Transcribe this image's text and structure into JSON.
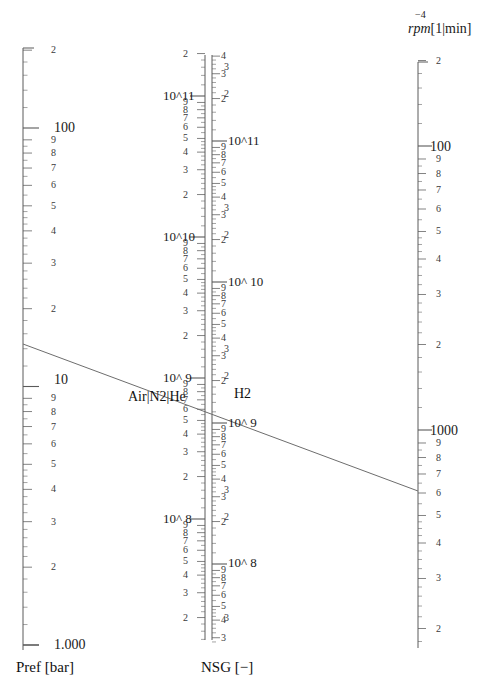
{
  "figure": {
    "type": "nomogram"
  },
  "axes": {
    "pref": {
      "title": "Pref [bar]",
      "orientation": "vertical",
      "direction": "ascending-upward",
      "scale": "log10",
      "top_value": "100",
      "bottom_value": "1.000",
      "decade_labels": [
        "1.000",
        "10",
        "100"
      ],
      "minor_labels": [
        "2",
        "3",
        "4",
        "5",
        "6",
        "7",
        "8",
        "9"
      ]
    },
    "nsg_left": {
      "title": "NSG [−]",
      "group_label": "Air|N2|He",
      "scale": "log10",
      "decade_labels": [
        "10^11",
        "10^10",
        "10^ 9",
        "10^ 8"
      ],
      "minor_labels": [
        "2",
        "3",
        "4",
        "5",
        "6",
        "7",
        "8",
        "9"
      ]
    },
    "nsg_right": {
      "group_label": "H2",
      "scale": "log10",
      "decade_labels": [
        "10^11",
        "10^ 10",
        "10^ 9",
        "10^ 8"
      ],
      "minor_labels": [
        "2",
        "3",
        "4",
        "5",
        "6",
        "7",
        "8",
        "9"
      ]
    },
    "rpm": {
      "title_italic": "rpm",
      "title_unit": "[1|min]",
      "exponent": "−4",
      "orientation": "vertical",
      "direction": "descending-downward",
      "scale": "log10",
      "decade_labels": [
        "100",
        "1000"
      ],
      "minor_labels": [
        "2",
        "3",
        "4",
        "5",
        "6",
        "7",
        "8",
        "9"
      ]
    }
  },
  "chart_data": {
    "type": "line",
    "title": "",
    "xlabel": "",
    "ylabel": "",
    "grid": false,
    "legend": "none",
    "scales": [
      {
        "name": "Pref [bar]",
        "type": "log",
        "range": [
          1.0,
          100.0
        ],
        "position": "left"
      },
      {
        "name": "NSG [-] Air|N2|He",
        "type": "log",
        "range": [
          100000000.0,
          300000000000.0
        ],
        "position": "center-left"
      },
      {
        "name": "NSG [-] H2",
        "type": "log",
        "range": [
          100000000.0,
          300000000000.0
        ],
        "position": "center-right"
      },
      {
        "name": "rpm [1/min]",
        "type": "log",
        "range": [
          50,
          5000
        ],
        "position": "right",
        "reversed": true
      }
    ],
    "series": [
      {
        "name": "alignment-line",
        "points": [
          {
            "scale": "Pref [bar]",
            "value": 13.9
          },
          {
            "scale": "NSG",
            "value": 6000000000.0
          },
          {
            "scale": "rpm [1/min]",
            "value": 1600
          }
        ]
      }
    ]
  },
  "pref_ticks": [
    {
      "label": "100",
      "y": 128,
      "major": true
    },
    {
      "label": "9",
      "y": 140,
      "major": false
    },
    {
      "label": "8",
      "y": 163,
      "major": false
    },
    {
      "label": "7",
      "y": 189,
      "major": false
    },
    {
      "label": "6",
      "y": 218,
      "major": false
    },
    {
      "label": "5",
      "y": 252,
      "major": false
    },
    {
      "label": "4",
      "y": 291,
      "major": false
    },
    {
      "label": "3",
      "y": 338,
      "major": false
    },
    {
      "label": "2",
      "y": 404,
      "major": false
    },
    {
      "label": "10",
      "y": 380,
      "major": true
    },
    {
      "label": "9",
      "y": 393,
      "major": false
    },
    {
      "label": "8",
      "y": 415,
      "major": false
    },
    {
      "label": "7",
      "y": 441,
      "major": false
    },
    {
      "label": "6",
      "y": 470,
      "major": false
    },
    {
      "label": "5",
      "y": 504,
      "major": false
    },
    {
      "label": "4",
      "y": 543,
      "major": false
    },
    {
      "label": "3",
      "y": 590,
      "major": false
    },
    {
      "label": "2",
      "y": 637,
      "major": false
    },
    {
      "label": "1.000",
      "y": 645,
      "major": true
    }
  ],
  "labels": {
    "pref_100": "100",
    "pref_10": "10",
    "pref_1": "1.000",
    "pref_title": "Pref [bar]",
    "nsg_title": "NSG [−]",
    "gas_left": "Air|N2|He",
    "gas_right": "H2",
    "nsg_left_e11": "10^11",
    "nsg_left_e10": "10^10",
    "nsg_left_e9": "10^ 9",
    "nsg_left_e8": "10^ 8",
    "nsg_right_e11": "10^11",
    "nsg_right_e10": "10^ 10",
    "nsg_right_e9": "10^ 9",
    "nsg_right_e8": "10^ 8",
    "rpm_name": "rpm",
    "rpm_unit": "[1|min]",
    "rpm_exp": "−4",
    "rpm_100": "100",
    "rpm_1000": "1000",
    "nsg_left_top_3": "3",
    "caption": ""
  },
  "minor_digits": [
    "9",
    "8",
    "7",
    "6",
    "5",
    "4",
    "3",
    "2"
  ],
  "colors": {
    "ink": "#1a1a1a",
    "axis": "#5a5a5a",
    "line": "#6d6d6d",
    "minor_text": "#3a3a3a",
    "background": "#ffffff"
  }
}
